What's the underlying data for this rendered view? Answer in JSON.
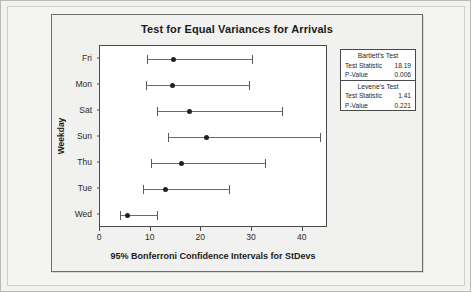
{
  "chart_data": {
    "type": "scatter",
    "title": "Test for Equal Variances for Arrivals",
    "xlabel": "95% Bonferroni Confidence Intervals for StDevs",
    "ylabel": "Weekday",
    "xlim": [
      0,
      45
    ],
    "xticks": [
      0,
      10,
      20,
      30,
      40
    ],
    "xticklabels": [
      "0",
      "10",
      "20",
      "30",
      "40"
    ],
    "grid": false,
    "legend": "none",
    "categories": [
      "Fri",
      "Mon",
      "Sat",
      "Sun",
      "Thu",
      "Tue",
      "Wed"
    ],
    "series": [
      {
        "name": "95% Bonferroni CI for StDev",
        "points": [
          {
            "category": "Fri",
            "center": 14.6,
            "lower": 9.3,
            "upper": 30.0
          },
          {
            "category": "Mon",
            "center": 14.3,
            "lower": 9.1,
            "upper": 29.4
          },
          {
            "category": "Sat",
            "center": 17.6,
            "lower": 11.2,
            "upper": 36.0
          },
          {
            "category": "Sun",
            "center": 21.0,
            "lower": 13.5,
            "upper": 43.4
          },
          {
            "category": "Thu",
            "center": 16.0,
            "lower": 10.1,
            "upper": 32.6
          },
          {
            "category": "Tue",
            "center": 13.0,
            "lower": 8.4,
            "upper": 25.4
          },
          {
            "category": "Wed",
            "center": 5.5,
            "lower": 3.9,
            "upper": 11.3
          }
        ]
      }
    ]
  },
  "stats": {
    "sections": [
      {
        "title": "Bartlett's Test",
        "rows": [
          {
            "key": "Test Statistic",
            "value": "18.19"
          },
          {
            "key": "P-Value",
            "value": "0.006"
          }
        ]
      },
      {
        "title": "Levene's Test",
        "rows": [
          {
            "key": "Test Statistic",
            "value": "1.41"
          },
          {
            "key": "P-Value",
            "value": "0.221"
          }
        ]
      }
    ]
  }
}
